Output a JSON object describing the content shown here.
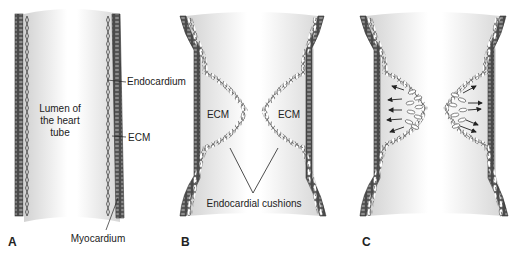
{
  "figure": {
    "panels": [
      {
        "letter": "A",
        "labels": {
          "lumen_line1": "Lumen of",
          "lumen_line2": "the heart",
          "lumen_line3": "tube",
          "endocardium": "Endocardium",
          "ecm": "ECM",
          "myocardium": "Myocardium"
        }
      },
      {
        "letter": "B",
        "labels": {
          "ecm_left": "ECM",
          "ecm_right": "ECM",
          "cushions": "Endocardial cushions"
        }
      },
      {
        "letter": "C",
        "labels": {}
      }
    ],
    "colors": {
      "myocardium": "#4a4a4a",
      "myocardium_stripe": "#8a8a8a",
      "lumen_shade": "#d8d8d8",
      "lumen_light": "#ffffff",
      "line": "#333333",
      "text": "#222222"
    }
  }
}
